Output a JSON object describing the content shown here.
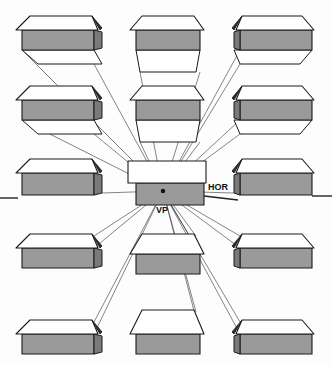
{
  "diagram": {
    "title": "",
    "labels": {
      "vanishing_point": "VP",
      "horizon": "HOR"
    },
    "vanishing_point": {
      "x": 163,
      "y": 191
    },
    "horizon_y": 191,
    "colors": {
      "roof": "#ffffff",
      "wall": "#9a9a9a",
      "gable": "#2a2a2a",
      "line": "#1a1a1a"
    },
    "houses": [
      {
        "row": 0,
        "col": 0,
        "x": 22,
        "y": 30,
        "w": 72,
        "h": 20,
        "roof": 14
      },
      {
        "row": 0,
        "col": 1,
        "x": 136,
        "y": 30,
        "w": 64,
        "h": 20,
        "roof": 14
      },
      {
        "row": 0,
        "col": 2,
        "x": 240,
        "y": 30,
        "w": 72,
        "h": 20,
        "roof": 14
      },
      {
        "row": 1,
        "col": 0,
        "x": 22,
        "y": 100,
        "w": 72,
        "h": 20,
        "roof": 14
      },
      {
        "row": 1,
        "col": 1,
        "x": 136,
        "y": 100,
        "w": 64,
        "h": 20,
        "roof": 14
      },
      {
        "row": 1,
        "col": 2,
        "x": 240,
        "y": 100,
        "w": 72,
        "h": 20,
        "roof": 14
      },
      {
        "row": 2,
        "col": 0,
        "x": 22,
        "y": 173,
        "w": 72,
        "h": 22,
        "roof": 14
      },
      {
        "row": 2,
        "col": 1,
        "x": 136,
        "y": 183,
        "w": 68,
        "h": 22,
        "roof": 22
      },
      {
        "row": 2,
        "col": 2,
        "x": 240,
        "y": 173,
        "w": 72,
        "h": 22,
        "roof": 14
      },
      {
        "row": 3,
        "col": 0,
        "x": 22,
        "y": 248,
        "w": 72,
        "h": 20,
        "roof": 14
      },
      {
        "row": 3,
        "col": 1,
        "x": 136,
        "y": 254,
        "w": 64,
        "h": 20,
        "roof": 20
      },
      {
        "row": 3,
        "col": 2,
        "x": 240,
        "y": 248,
        "w": 72,
        "h": 20,
        "roof": 14
      },
      {
        "row": 4,
        "col": 0,
        "x": 22,
        "y": 334,
        "w": 72,
        "h": 20,
        "roof": 14
      },
      {
        "row": 4,
        "col": 1,
        "x": 136,
        "y": 334,
        "w": 64,
        "h": 20,
        "roof": 24
      },
      {
        "row": 4,
        "col": 2,
        "x": 240,
        "y": 334,
        "w": 72,
        "h": 20,
        "roof": 14
      }
    ]
  }
}
